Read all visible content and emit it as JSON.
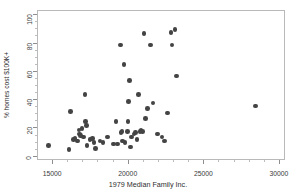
{
  "chart_data": {
    "type": "scatter",
    "title": "",
    "xlabel": "1979 Median Family Inc.",
    "ylabel": "% homes cost $100K+",
    "xlim": [
      14000,
      30400
    ],
    "ylim": [
      -3,
      103
    ],
    "xticks": [
      15000,
      20000,
      25000,
      30000
    ],
    "yticks": [
      0,
      20,
      40,
      60,
      80,
      100
    ],
    "grid": false,
    "legend": null,
    "marker": {
      "shape": "circle",
      "color": "#444444",
      "size_px": 4.6
    },
    "frame_color": "#b9b9b9",
    "points": [
      {
        "x": 14700,
        "y": 8
      },
      {
        "x": 16050,
        "y": 5
      },
      {
        "x": 16150,
        "y": 32
      },
      {
        "x": 16350,
        "y": 12
      },
      {
        "x": 16450,
        "y": 13
      },
      {
        "x": 16600,
        "y": 11
      },
      {
        "x": 16700,
        "y": 19
      },
      {
        "x": 16750,
        "y": 16
      },
      {
        "x": 16800,
        "y": 15
      },
      {
        "x": 16900,
        "y": 20
      },
      {
        "x": 17000,
        "y": 14
      },
      {
        "x": 17100,
        "y": 44
      },
      {
        "x": 17150,
        "y": 25
      },
      {
        "x": 17200,
        "y": 22
      },
      {
        "x": 17250,
        "y": 8
      },
      {
        "x": 17450,
        "y": 12
      },
      {
        "x": 17600,
        "y": 13
      },
      {
        "x": 17700,
        "y": 10
      },
      {
        "x": 17800,
        "y": 6
      },
      {
        "x": 18100,
        "y": 11
      },
      {
        "x": 18300,
        "y": 10
      },
      {
        "x": 18600,
        "y": 14
      },
      {
        "x": 19000,
        "y": 9
      },
      {
        "x": 19150,
        "y": 25
      },
      {
        "x": 19250,
        "y": 9
      },
      {
        "x": 19450,
        "y": 79
      },
      {
        "x": 19500,
        "y": 17
      },
      {
        "x": 19550,
        "y": 18
      },
      {
        "x": 19600,
        "y": 11
      },
      {
        "x": 19700,
        "y": 65
      },
      {
        "x": 19750,
        "y": 10
      },
      {
        "x": 19900,
        "y": 18
      },
      {
        "x": 19950,
        "y": 25
      },
      {
        "x": 19980,
        "y": 39
      },
      {
        "x": 20050,
        "y": 54
      },
      {
        "x": 20100,
        "y": 7
      },
      {
        "x": 20200,
        "y": 14
      },
      {
        "x": 20350,
        "y": 16
      },
      {
        "x": 20450,
        "y": 17
      },
      {
        "x": 20550,
        "y": 12
      },
      {
        "x": 20650,
        "y": 44
      },
      {
        "x": 20750,
        "y": 18
      },
      {
        "x": 20800,
        "y": 19
      },
      {
        "x": 20900,
        "y": 18
      },
      {
        "x": 21000,
        "y": 87
      },
      {
        "x": 21100,
        "y": 27
      },
      {
        "x": 21250,
        "y": 34
      },
      {
        "x": 21450,
        "y": 79
      },
      {
        "x": 21600,
        "y": 38
      },
      {
        "x": 21900,
        "y": 16
      },
      {
        "x": 22200,
        "y": 14
      },
      {
        "x": 22350,
        "y": 11
      },
      {
        "x": 22550,
        "y": 31
      },
      {
        "x": 22800,
        "y": 88
      },
      {
        "x": 22850,
        "y": 79
      },
      {
        "x": 23050,
        "y": 90
      },
      {
        "x": 23150,
        "y": 57
      },
      {
        "x": 28400,
        "y": 36
      }
    ]
  }
}
